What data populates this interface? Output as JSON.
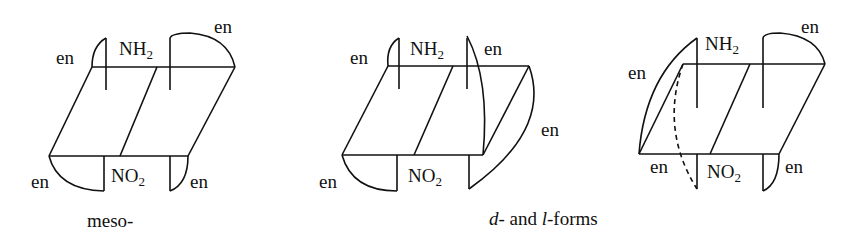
{
  "figure": {
    "structures": [
      {
        "id": "meso",
        "top_group": {
          "symbol": "NH",
          "sub": "2"
        },
        "bottom_group": {
          "symbol": "NO",
          "sub": "2"
        },
        "ligand_labels": [
          "en",
          "en",
          "en",
          "en"
        ]
      },
      {
        "id": "d-form",
        "top_group": {
          "symbol": "NH",
          "sub": "2"
        },
        "bottom_group": {
          "symbol": "NO",
          "sub": "2"
        },
        "ligand_labels": [
          "en",
          "en",
          "en",
          "en"
        ]
      },
      {
        "id": "l-form",
        "top_group": {
          "symbol": "NH",
          "sub": "2"
        },
        "bottom_group": {
          "symbol": "NO",
          "sub": "2"
        },
        "ligand_labels": [
          "en",
          "en",
          "en",
          "en"
        ]
      }
    ],
    "captions": {
      "meso": "meso-",
      "dl_part1": "d",
      "dl_part2": "- and ",
      "dl_part3": "l",
      "dl_part4": "-forms"
    },
    "colors": {
      "line": "#111111",
      "background": "#ffffff"
    }
  }
}
